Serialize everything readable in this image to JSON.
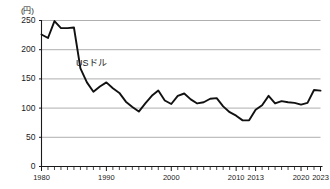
{
  "chart_data": {
    "type": "line",
    "title": "",
    "subtitle": "",
    "xlabel": "",
    "ylabel": "",
    "unit_label": "(円)",
    "grid": true,
    "legend_position": "inline-annotation",
    "xlim": [
      1980,
      2023
    ],
    "ylim": [
      0,
      250
    ],
    "y_ticks": [
      0,
      50,
      100,
      150,
      200,
      250
    ],
    "y_tick_labels": [
      "0",
      "50",
      "100",
      "150",
      "200",
      "250"
    ],
    "x_tick_labels": [
      "1980",
      "1990",
      "2000",
      "2010",
      "2013",
      "2020",
      "2023"
    ],
    "x_tick_label_years": [
      1980,
      1990,
      2000,
      2010,
      2013,
      2020,
      2023
    ],
    "x_minor_tick_interval": 1,
    "annotations": [
      {
        "text": "USドル",
        "x": 1987,
        "y": 172
      }
    ],
    "series": [
      {
        "name": "USドル",
        "color": "#111111",
        "x": [
          1980,
          1981,
          1982,
          1983,
          1984,
          1985,
          1986,
          1987,
          1988,
          1989,
          1990,
          1991,
          1992,
          1993,
          1994,
          1995,
          1996,
          1997,
          1998,
          1999,
          2000,
          2001,
          2002,
          2003,
          2004,
          2005,
          2006,
          2007,
          2008,
          2009,
          2010,
          2011,
          2012,
          2013,
          2014,
          2015,
          2016,
          2017,
          2018,
          2019,
          2020,
          2021,
          2022,
          2023
        ],
        "values": [
          226,
          220,
          249,
          237,
          237,
          238,
          168,
          144,
          128,
          137,
          144,
          134,
          126,
          111,
          102,
          94,
          108,
          121,
          130,
          113,
          107,
          121,
          125,
          115,
          108,
          110,
          116,
          117,
          103,
          93,
          87,
          79,
          79,
          97,
          105,
          121,
          108,
          112,
          110,
          109,
          106,
          109,
          131,
          130
        ]
      }
    ]
  }
}
